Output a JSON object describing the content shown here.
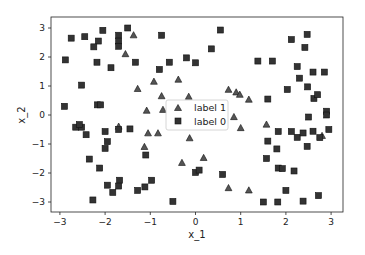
{
  "chart_data": {
    "type": "scatter",
    "title": "",
    "xlabel": "x_1",
    "ylabel": "x_2",
    "xlim": [
      -3.2,
      3.25
    ],
    "ylim": [
      -3.35,
      3.4
    ],
    "xticks": [
      -3,
      -2,
      -1,
      0,
      1,
      2,
      3
    ],
    "yticks": [
      -3,
      -2,
      -1,
      0,
      1,
      2,
      3
    ],
    "grid": false,
    "legend_position": "center",
    "series": [
      {
        "name": "label 1",
        "marker": "triangle",
        "color": "#555555",
        "edgecolor": "#111111",
        "points": [
          [
            -1.37,
            2.75
          ],
          [
            -1.55,
            2.1
          ],
          [
            -1.28,
            0.9
          ],
          [
            -0.92,
            1.15
          ],
          [
            -0.75,
            0.65
          ],
          [
            -1.08,
            0.15
          ],
          [
            -0.72,
            0.18
          ],
          [
            -0.38,
            1.22
          ],
          [
            -0.15,
            0.63
          ],
          [
            0.73,
            0.87
          ],
          [
            0.9,
            0.78
          ],
          [
            0.98,
            0.7
          ],
          [
            1.18,
            0.53
          ],
          [
            0.85,
            -0.07
          ],
          [
            1.0,
            -0.45
          ],
          [
            -0.13,
            -0.8
          ],
          [
            -1.7,
            -0.4
          ],
          [
            -1.05,
            -0.63
          ],
          [
            -0.83,
            -0.63
          ],
          [
            -1.13,
            -1.1
          ],
          [
            -0.3,
            -1.65
          ],
          [
            0.18,
            -1.48
          ],
          [
            0.73,
            -2.52
          ],
          [
            1.18,
            -2.6
          ],
          [
            1.57,
            -0.33
          ],
          [
            2.8,
            -0.72
          ]
        ]
      },
      {
        "name": "label 0",
        "marker": "square",
        "color": "#333333",
        "edgecolor": "#111111",
        "points": [
          [
            -2.75,
            2.65
          ],
          [
            -2.45,
            2.7
          ],
          [
            -2.05,
            2.92
          ],
          [
            -2.15,
            2.55
          ],
          [
            -2.25,
            2.35
          ],
          [
            -2.88,
            1.9
          ],
          [
            -2.18,
            1.82
          ],
          [
            -1.87,
            1.63
          ],
          [
            -1.7,
            2.75
          ],
          [
            -1.7,
            2.55
          ],
          [
            -1.7,
            2.37
          ],
          [
            -1.5,
            3.0
          ],
          [
            -0.75,
            2.75
          ],
          [
            -1.33,
            1.82
          ],
          [
            -0.58,
            1.82
          ],
          [
            -0.2,
            1.97
          ],
          [
            0.0,
            1.8
          ],
          [
            -0.8,
            1.57
          ],
          [
            0.35,
            2.28
          ],
          [
            0.55,
            2.93
          ],
          [
            2.12,
            2.6
          ],
          [
            2.47,
            2.78
          ],
          [
            2.42,
            2.33
          ],
          [
            1.38,
            1.86
          ],
          [
            1.7,
            1.86
          ],
          [
            2.25,
            1.67
          ],
          [
            2.6,
            1.48
          ],
          [
            2.85,
            1.48
          ],
          [
            2.3,
            1.27
          ],
          [
            2.03,
            0.88
          ],
          [
            2.48,
            0.97
          ],
          [
            -2.52,
            1.03
          ],
          [
            -2.9,
            0.3
          ],
          [
            -2.17,
            0.35
          ],
          [
            -2.1,
            0.35
          ],
          [
            -2.65,
            -0.42
          ],
          [
            -2.52,
            -0.42
          ],
          [
            -2.57,
            -0.33
          ],
          [
            -2.42,
            -0.68
          ],
          [
            -1.7,
            -0.5
          ],
          [
            -1.45,
            -0.48
          ],
          [
            -2.0,
            -0.57
          ],
          [
            -1.95,
            -0.92
          ],
          [
            -2.0,
            -1.15
          ],
          [
            -1.1,
            -1.38
          ],
          [
            -2.35,
            -1.52
          ],
          [
            -2.12,
            -1.83
          ],
          [
            -1.68,
            -2.25
          ],
          [
            -1.95,
            -2.42
          ],
          [
            -1.7,
            -2.45
          ],
          [
            -1.83,
            -2.67
          ],
          [
            -2.27,
            -2.93
          ],
          [
            -0.97,
            -2.25
          ],
          [
            -1.12,
            -2.48
          ],
          [
            -1.28,
            -2.6
          ],
          [
            -0.5,
            -2.98
          ],
          [
            0.0,
            -1.98
          ],
          [
            0.08,
            -1.9
          ],
          [
            0.6,
            -2.05
          ],
          [
            1.6,
            0.55
          ],
          [
            2.62,
            0.57
          ],
          [
            2.7,
            0.7
          ],
          [
            2.9,
            0.13
          ],
          [
            2.9,
            0.0
          ],
          [
            2.5,
            -0.07
          ],
          [
            1.83,
            -0.57
          ],
          [
            2.12,
            -0.57
          ],
          [
            2.95,
            -0.5
          ],
          [
            2.25,
            -0.77
          ],
          [
            2.38,
            -0.62
          ],
          [
            2.6,
            -0.56
          ],
          [
            2.75,
            -0.78
          ],
          [
            1.6,
            -0.9
          ],
          [
            2.47,
            -1.08
          ],
          [
            1.8,
            -1.17
          ],
          [
            1.57,
            -1.5
          ],
          [
            1.83,
            -1.83
          ],
          [
            1.92,
            -1.85
          ],
          [
            2.18,
            -1.93
          ],
          [
            2.0,
            -2.6
          ],
          [
            2.72,
            -2.78
          ],
          [
            1.5,
            -3.0
          ],
          [
            1.82,
            -3.0
          ],
          [
            2.38,
            -2.97
          ]
        ]
      }
    ]
  },
  "legend": {
    "items": [
      {
        "label": "label 1",
        "marker": "triangle"
      },
      {
        "label": "label 0",
        "marker": "square"
      }
    ]
  },
  "axes": {
    "xlabel": "x_1",
    "ylabel": "x_2"
  }
}
